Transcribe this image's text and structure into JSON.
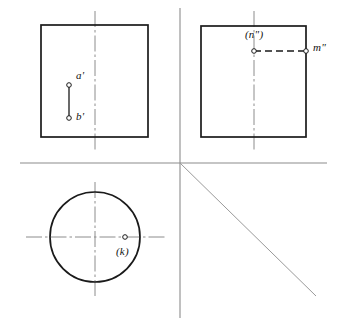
{
  "drawing": {
    "title": "Orthographic projection exercise",
    "background_color": "#ffffff",
    "outline_color": "#1a1a1a",
    "axis_color": "#8c8c8c",
    "centerline_color": "#8c8c8c",
    "point_marker_color": "#1a1a1a",
    "projection_axis": {
      "name": "projection-axis",
      "horizontal": {
        "x1": 20,
        "y1": 163,
        "x2": 327,
        "y2": 163
      },
      "vertical": {
        "x1": 180,
        "y1": 8,
        "x2": 180,
        "y2": 318
      },
      "miter_line": {
        "x1": 180,
        "y1": 163,
        "x2": 316,
        "y2": 296,
        "angle_deg": 45
      }
    },
    "views": [
      {
        "name": "front-view",
        "shape": "square",
        "rect": {
          "x": 41,
          "y": 25,
          "width": 107,
          "height": 112
        },
        "centerline_vertical": {
          "x": 95,
          "y1": 11,
          "y2": 150
        },
        "points": [
          {
            "id": "a-prime",
            "label": "a'",
            "cx": 69,
            "cy": 85,
            "label_x": 76,
            "label_y": 76
          },
          {
            "id": "b-prime",
            "label": "b'",
            "cx": 69,
            "cy": 118,
            "label_x": 76,
            "label_y": 114
          }
        ],
        "segments": [
          {
            "id": "ab-prime-segment",
            "style": "solid",
            "x1": 69,
            "y1": 85,
            "x2": 69,
            "y2": 118
          }
        ]
      },
      {
        "name": "side-view",
        "shape": "square",
        "rect": {
          "x": 201,
          "y": 26,
          "width": 105,
          "height": 111
        },
        "centerline_vertical": {
          "x": 254,
          "y1": 11,
          "y2": 151
        },
        "points": [
          {
            "id": "n-double-prime",
            "label": "(n\")",
            "cx": 254,
            "cy": 51,
            "label_x": 246,
            "label_y": 32
          },
          {
            "id": "m-double-prime",
            "label": "m\"",
            "cx": 306,
            "cy": 51,
            "label_x": 313,
            "label_y": 45
          }
        ],
        "segments": [
          {
            "id": "mn-double-prime-segment",
            "style": "dashed",
            "x1": 254,
            "y1": 51,
            "x2": 306,
            "y2": 51
          }
        ]
      },
      {
        "name": "top-view",
        "shape": "circle",
        "circle": {
          "cx": 95,
          "cy": 237,
          "r": 45
        },
        "centerline_vertical": {
          "x": 95,
          "y1": 182,
          "y2": 296
        },
        "centerline_horizontal": {
          "y": 237,
          "x1": 26,
          "x2": 165
        },
        "points": [
          {
            "id": "k-point",
            "label": "(k)",
            "cx": 125,
            "cy": 237,
            "label_x": 116,
            "label_y": 246
          }
        ],
        "segments": []
      }
    ],
    "labels": [
      {
        "id": "label-a-prime",
        "text": "a'"
      },
      {
        "id": "label-b-prime",
        "text": "b'"
      },
      {
        "id": "label-n-double-prime",
        "text": "(n\")"
      },
      {
        "id": "label-m-double-prime",
        "text": "m\""
      },
      {
        "id": "label-k",
        "text": "(k)"
      }
    ]
  }
}
